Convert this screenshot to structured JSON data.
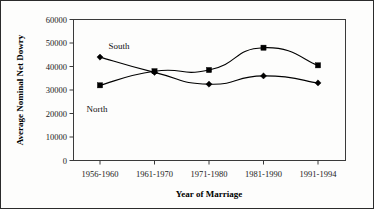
{
  "chart_data": {
    "type": "line",
    "title": "",
    "xlabel": "Year of Marriage",
    "ylabel": "Average Nominal Net Dowry",
    "categories": [
      "1956-1960",
      "1961-1970",
      "1971-1980",
      "1981-1990",
      "1991-1994"
    ],
    "ylim": [
      0,
      60000
    ],
    "ytick_labels": [
      "0",
      "10000",
      "20000",
      "30000",
      "40000",
      "50000",
      "60000"
    ],
    "ytick_values": [
      0,
      10000,
      20000,
      30000,
      40000,
      50000,
      60000
    ],
    "grid": false,
    "legend_position": "inline-annotations",
    "series": [
      {
        "name": "South",
        "marker": "diamond",
        "values": [
          44000,
          37500,
          32500,
          36000,
          33000
        ],
        "annotation": "South"
      },
      {
        "name": "North",
        "marker": "square",
        "values": [
          32000,
          38000,
          38500,
          48000,
          40500
        ],
        "annotation": "North"
      }
    ],
    "annotations": [
      {
        "text": "South",
        "series": "South"
      },
      {
        "text": "North",
        "series": "North"
      }
    ],
    "colors": {
      "line": "#000000",
      "marker": "#000000",
      "axis": "#3a3a3a",
      "background": "#fdfdfc",
      "border": "#2b2b2b"
    }
  }
}
